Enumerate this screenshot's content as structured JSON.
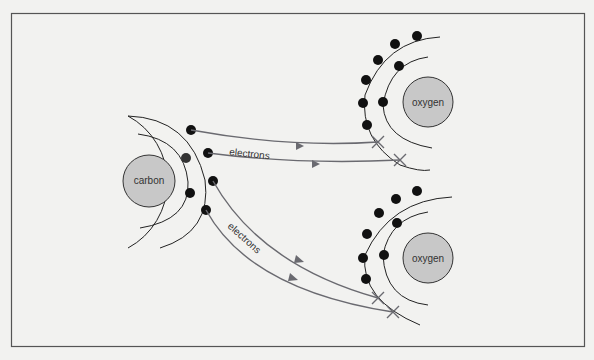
{
  "diagram": {
    "colors": {
      "background": "#f2f2f0",
      "atom": "#c8c8c8",
      "electron": "#111111",
      "arrow": "#6a6a70",
      "shell": "#222222"
    },
    "atoms": [
      {
        "id": "carbon",
        "label": "carbon"
      },
      {
        "id": "oxygen-top",
        "label": "oxygen"
      },
      {
        "id": "oxygen-bottom",
        "label": "oxygen"
      }
    ],
    "arrow_labels": {
      "top": "electrons",
      "bottom": "electrons"
    }
  }
}
